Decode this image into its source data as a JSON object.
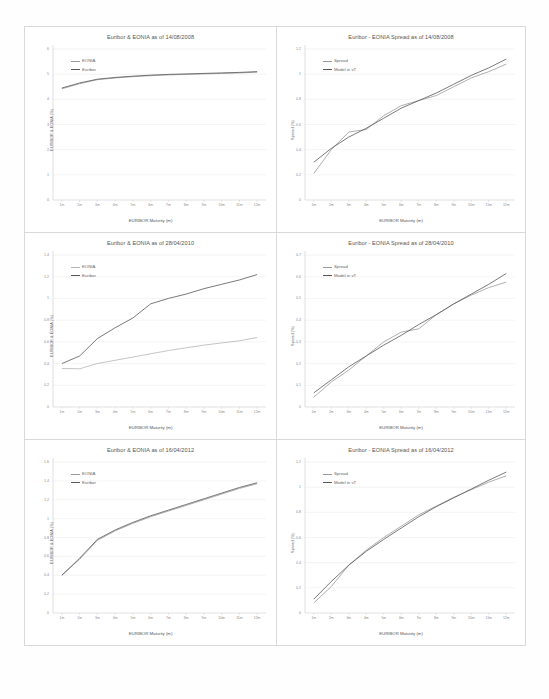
{
  "page": {
    "background": "#ffffff",
    "panel_border": "#d9d9d9"
  },
  "axis": {
    "xlabel": "EURIBOR Maturity (m)",
    "xticks": [
      "1m",
      "2m",
      "3m",
      "4m",
      "5m",
      "6m",
      "7m",
      "8m",
      "9m",
      "10m",
      "11m",
      "12m"
    ],
    "ylabel_rates": "EURIBOR & EONIA (%)",
    "ylabel_spread": "Spread (%)"
  },
  "legends": {
    "rates": [
      "EONIA",
      "Euribor"
    ],
    "spread": [
      "Spread",
      "Model in vT"
    ]
  },
  "colors": {
    "series_light": "#9a9a9a",
    "series_dark": "#585858",
    "gridline": "#e6e6e6",
    "axis": "#bdbdbd",
    "title": "#555555",
    "tick": "#8a8a8a"
  },
  "chart_data": [
    {
      "id": "rates-2008",
      "type": "line",
      "title": "Euribor & EONIA as of 14/08/2008",
      "xlabel": "EURIBOR Maturity (m)",
      "ylabel": "EURIBOR & EONIA (%)",
      "categories": [
        "1m",
        "2m",
        "3m",
        "4m",
        "5m",
        "6m",
        "7m",
        "8m",
        "9m",
        "10m",
        "11m",
        "12m"
      ],
      "yticks": [
        "6",
        "5",
        "4",
        "3",
        "2",
        "1",
        "0"
      ],
      "ylim": [
        0,
        6
      ],
      "grid": true,
      "legend_position": "top-left",
      "series": [
        {
          "name": "EONIA",
          "color": "#9a9a9a",
          "values": [
            4.42,
            4.62,
            4.78,
            4.85,
            4.9,
            4.94,
            4.97,
            4.99,
            5.01,
            5.03,
            5.05,
            5.08
          ]
        },
        {
          "name": "Euribor",
          "color": "#585858",
          "values": [
            4.45,
            4.65,
            4.8,
            4.87,
            4.92,
            4.96,
            4.99,
            5.01,
            5.03,
            5.05,
            5.07,
            5.1
          ]
        }
      ]
    },
    {
      "id": "spread-2008",
      "type": "line",
      "title": "Euribor - EONIA Spread as of 14/08/2008",
      "xlabel": "EURIBOR Maturity (m)",
      "ylabel": "Spread (%)",
      "categories": [
        "1m",
        "2m",
        "3m",
        "4m",
        "5m",
        "6m",
        "7m",
        "8m",
        "9m",
        "10m",
        "11m",
        "12m"
      ],
      "yticks": [
        "1.2",
        "1",
        "0.8",
        "0.6",
        "0.4",
        "0.2",
        "0"
      ],
      "ylim": [
        0,
        1.2
      ],
      "grid": true,
      "legend_position": "top-left",
      "series": [
        {
          "name": "Spread",
          "color": "#9a9a9a",
          "values": [
            0.21,
            0.4,
            0.54,
            0.56,
            0.67,
            0.75,
            0.79,
            0.83,
            0.9,
            0.97,
            1.02,
            1.08
          ]
        },
        {
          "name": "Model in vT",
          "color": "#585858",
          "values": [
            0.3,
            0.41,
            0.5,
            0.57,
            0.65,
            0.73,
            0.79,
            0.85,
            0.92,
            0.99,
            1.05,
            1.12
          ]
        }
      ]
    },
    {
      "id": "rates-2010",
      "type": "line",
      "title": "Euribor & EONIA as of 28/04/2010",
      "xlabel": "EURIBOR Maturity (m)",
      "ylabel": "EURIBOR & EONIA (%)",
      "categories": [
        "1m",
        "2m",
        "3m",
        "4m",
        "5m",
        "6m",
        "7m",
        "8m",
        "9m",
        "10m",
        "11m",
        "12m"
      ],
      "yticks": [
        "1.4",
        "1.2",
        "1",
        "0.8",
        "0.6",
        "0.4",
        "0.2",
        "0"
      ],
      "ylim": [
        0,
        1.4
      ],
      "grid": true,
      "legend_position": "top-left",
      "series": [
        {
          "name": "EONIA",
          "color": "#b5b5b5",
          "values": [
            0.355,
            0.352,
            0.4,
            0.43,
            0.46,
            0.49,
            0.52,
            0.545,
            0.57,
            0.59,
            0.61,
            0.64
          ]
        },
        {
          "name": "Euribor",
          "color": "#585858",
          "values": [
            0.4,
            0.47,
            0.63,
            0.73,
            0.82,
            0.95,
            1.0,
            1.04,
            1.09,
            1.13,
            1.17,
            1.22
          ]
        }
      ]
    },
    {
      "id": "spread-2010",
      "type": "line",
      "title": "Euribor - EONIA Spread as of 28/04/2010",
      "xlabel": "EURIBOR Maturity (m)",
      "ylabel": "Spread (%)",
      "categories": [
        "1m",
        "2m",
        "3m",
        "4m",
        "5m",
        "6m",
        "7m",
        "8m",
        "9m",
        "10m",
        "11m",
        "12m"
      ],
      "yticks": [
        "0.7",
        "0.6",
        "0.5",
        "0.4",
        "0.3",
        "0.2",
        "0.1",
        "0"
      ],
      "ylim": [
        0,
        0.7
      ],
      "grid": true,
      "legend_position": "top-left",
      "series": [
        {
          "name": "Spread",
          "color": "#9a9a9a",
          "values": [
            0.045,
            0.115,
            0.17,
            0.235,
            0.3,
            0.345,
            0.36,
            0.425,
            0.475,
            0.515,
            0.55,
            0.575
          ]
        },
        {
          "name": "Model in vT",
          "color": "#585858",
          "values": [
            0.065,
            0.125,
            0.185,
            0.235,
            0.285,
            0.33,
            0.38,
            0.425,
            0.475,
            0.52,
            0.565,
            0.615
          ]
        }
      ]
    },
    {
      "id": "rates-2012",
      "type": "line",
      "title": "Euribor & EONIA as of 16/04/2012",
      "xlabel": "EURIBOR Maturity (m)",
      "ylabel": "EURIBOR & EONIA (%)",
      "categories": [
        "1m",
        "2m",
        "3m",
        "4m",
        "5m",
        "6m",
        "7m",
        "8m",
        "9m",
        "10m",
        "11m",
        "12m"
      ],
      "yticks": [
        "1.6",
        "1.4",
        "1.2",
        "1",
        "0.8",
        "0.6",
        "0.4",
        "0.2",
        "0"
      ],
      "ylim": [
        0,
        1.6
      ],
      "grid": true,
      "legend_position": "top-left",
      "series": [
        {
          "name": "EONIA",
          "color": "#9a9a9a",
          "values": [
            0.4,
            0.57,
            0.77,
            0.87,
            0.95,
            1.02,
            1.08,
            1.14,
            1.2,
            1.26,
            1.32,
            1.37
          ]
        },
        {
          "name": "Euribor",
          "color": "#585858",
          "values": [
            0.4,
            0.58,
            0.78,
            0.88,
            0.96,
            1.03,
            1.09,
            1.15,
            1.21,
            1.27,
            1.33,
            1.38
          ]
        }
      ]
    },
    {
      "id": "spread-2012",
      "type": "line",
      "title": "Euribor - EONIA Spread as of 16/04/2012",
      "xlabel": "EURIBOR Maturity (m)",
      "ylabel": "Spread (%)",
      "categories": [
        "1m",
        "2m",
        "3m",
        "4m",
        "5m",
        "6m",
        "7m",
        "8m",
        "9m",
        "10m",
        "11m",
        "12m"
      ],
      "yticks": [
        "1.2",
        "1",
        "0.8",
        "0.6",
        "0.4",
        "0.2",
        "0"
      ],
      "ylim": [
        0,
        1.2
      ],
      "grid": true,
      "legend_position": "top-left",
      "series": [
        {
          "name": "Spread",
          "color": "#9a9a9a",
          "values": [
            0.08,
            0.21,
            0.38,
            0.5,
            0.6,
            0.69,
            0.78,
            0.85,
            0.92,
            0.98,
            1.04,
            1.09
          ]
        },
        {
          "name": "Model in vT",
          "color": "#585858",
          "values": [
            0.11,
            0.25,
            0.38,
            0.49,
            0.585,
            0.675,
            0.765,
            0.845,
            0.915,
            0.985,
            1.055,
            1.12
          ]
        }
      ]
    }
  ]
}
